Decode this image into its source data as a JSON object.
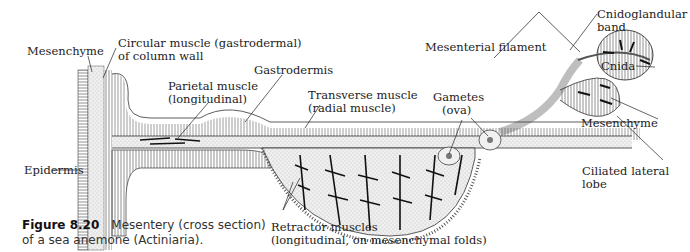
{
  "figure": {
    "number": "Figure 8.20",
    "caption_line1": "Mesentery (cross section)",
    "caption_line2": "of a sea anemone (Actiniaria)."
  },
  "labels": {
    "mesenchyme_left": "Mesenchyme",
    "circular_muscle_1": "Circular muscle (gastrodermal)",
    "circular_muscle_2": "of column wall",
    "parietal_1": "Parietal muscle",
    "parietal_2": "(longitudinal)",
    "gastrodermis": "Gastrodermis",
    "transverse_1": "Transverse muscle",
    "transverse_2": "(radial muscle)",
    "gametes_1": "Gametes",
    "gametes_2": "(ova)",
    "mesenterial_filament": "Mesenterial filament",
    "cnidoglandular_1": "Cnidoglandular",
    "cnidoglandular_2": "band",
    "cnida": "Cnida",
    "mesenchyme_right": "Mesenchyme",
    "ciliated_1": "Ciliated lateral",
    "ciliated_2": "lobe",
    "epidermis": "Epidermis",
    "retractor_1": "Retractor muscles",
    "retractor_2": "(longitudinal, on mesenchymal folds)"
  }
}
